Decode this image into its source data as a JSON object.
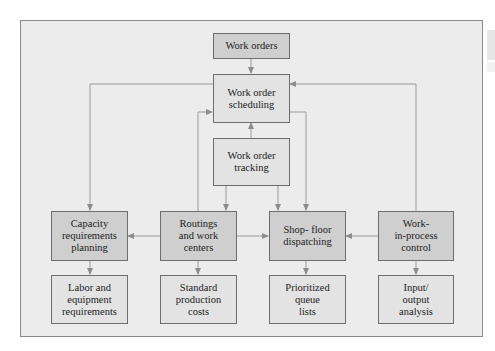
{
  "diagram": {
    "colors": {
      "frame_bg": "#ececec",
      "box_dark": "#cfcfcf",
      "box_light": "#e3e3e3",
      "line": "#8c8c8c",
      "border": "#6d6d6d"
    },
    "nodes": {
      "work_orders": "Work orders",
      "scheduling": "Work order\nscheduling",
      "tracking": "Work order\ntracking",
      "capacity": "Capacity\nrequirements\nplanning",
      "routings": "Routings\nand work\ncenters",
      "dispatching": "Shop- floor\ndispatching",
      "wip": "Work-\nin-process\ncontrol",
      "labor": "Labor and\nequipment\nrequirements",
      "costs": "Standard\nproduction\ncosts",
      "queue": "Prioritized\nqueue\nlists",
      "io": "Input/\noutput\nanalysis"
    },
    "edges": [
      {
        "from": "Work orders",
        "to": "Work order scheduling"
      },
      {
        "from": "Work order scheduling",
        "to": "Capacity requirements planning"
      },
      {
        "from": "Work order scheduling",
        "to": "Shop- floor dispatching"
      },
      {
        "from": "Work order tracking",
        "to": "Work order scheduling"
      },
      {
        "from": "Work order tracking",
        "to": "Routings and work centers",
        "bidirectional": true
      },
      {
        "from": "Work order tracking",
        "to": "Shop- floor dispatching",
        "bidirectional": true
      },
      {
        "from": "Routings and work centers",
        "to": "Work order scheduling"
      },
      {
        "from": "Routings and work centers",
        "to": "Capacity requirements planning"
      },
      {
        "from": "Routings and work centers",
        "to": "Shop- floor dispatching"
      },
      {
        "from": "Work-in-process control",
        "to": "Shop- floor dispatching"
      },
      {
        "from": "Work-in-process control",
        "to": "Work order scheduling"
      },
      {
        "from": "Capacity requirements planning",
        "to": "Labor and equipment requirements"
      },
      {
        "from": "Routings and work centers",
        "to": "Standard production costs"
      },
      {
        "from": "Shop- floor dispatching",
        "to": "Prioritized queue lists"
      },
      {
        "from": "Work-in-process control",
        "to": "Input/output analysis"
      }
    ]
  }
}
